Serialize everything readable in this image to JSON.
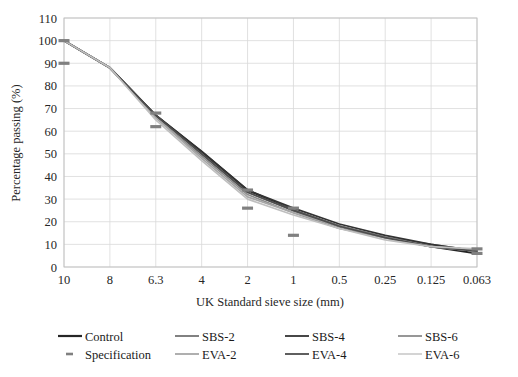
{
  "chart_data": {
    "type": "line",
    "title": "",
    "subtitle": "",
    "xlabel": "UK Standard sieve size (mm)",
    "ylabel": "Percentage passing (%)",
    "categories": [
      "10",
      "8",
      "6.3",
      "4",
      "2",
      "1",
      "0.5",
      "0.25",
      "0.125",
      "0.063"
    ],
    "x_axis_scale": "categorical-descending-sieve",
    "ylim": [
      0,
      110
    ],
    "ytick_step": 10,
    "yticks": [
      "110",
      "100",
      "90",
      "80",
      "70",
      "60",
      "50",
      "40",
      "30",
      "20",
      "10",
      "0"
    ],
    "grid": {
      "horizontal": true,
      "vertical": true,
      "color": "#d9d9d9"
    },
    "legend_position": "bottom",
    "legend_columns": 4,
    "series": [
      {
        "name": "Control",
        "color": "#262626",
        "style": "solid",
        "width": 2.0,
        "values": [
          100,
          88,
          67,
          51,
          34,
          25,
          18,
          13,
          9,
          6
        ]
      },
      {
        "name": "SBS-2",
        "color": "#737373",
        "style": "solid",
        "width": 1.7,
        "values": [
          100,
          88,
          67,
          50,
          33,
          25,
          18,
          13,
          10,
          7
        ]
      },
      {
        "name": "SBS-4",
        "color": "#333333",
        "style": "solid",
        "width": 1.7,
        "values": [
          100,
          88,
          67,
          51,
          34,
          26,
          19,
          14,
          10,
          7
        ]
      },
      {
        "name": "SBS-6",
        "color": "#8c8c8c",
        "style": "solid",
        "width": 1.7,
        "values": [
          100,
          88,
          66,
          49,
          32,
          24,
          17,
          13,
          9,
          7
        ]
      },
      {
        "name": "Specification",
        "color": "#808080",
        "style": "dashed-markers",
        "width": 2.4,
        "values": [
          90,
          null,
          62,
          null,
          26,
          14,
          null,
          null,
          null,
          6
        ]
      },
      {
        "name": "EVA-2",
        "color": "#a6a6a6",
        "style": "solid",
        "width": 1.7,
        "values": [
          100,
          88,
          66,
          48,
          31,
          24,
          18,
          13,
          9,
          7
        ]
      },
      {
        "name": "EVA-4",
        "color": "#4d4d4d",
        "style": "solid",
        "width": 1.7,
        "values": [
          100,
          88,
          67,
          50,
          33,
          25,
          18,
          13,
          9,
          7
        ]
      },
      {
        "name": "EVA-6",
        "color": "#bfbfbf",
        "style": "solid",
        "width": 1.7,
        "values": [
          100,
          88,
          65,
          47,
          30,
          23,
          17,
          12,
          9,
          8
        ]
      }
    ],
    "spec_band_points": [
      {
        "category": "10",
        "value": 90
      },
      {
        "category": "10",
        "value": 100
      },
      {
        "category": "6.3",
        "value": 62
      },
      {
        "category": "6.3",
        "value": 68
      },
      {
        "category": "2",
        "value": 26
      },
      {
        "category": "2",
        "value": 34
      },
      {
        "category": "1",
        "value": 14
      },
      {
        "category": "1",
        "value": 26
      },
      {
        "category": "0.063",
        "value": 6
      },
      {
        "category": "0.063",
        "value": 8
      }
    ]
  },
  "legend": {
    "items": [
      {
        "label": "Control",
        "color": "#262626",
        "style": "solid",
        "width": 2.2
      },
      {
        "label": "SBS-2",
        "color": "#737373",
        "style": "solid",
        "width": 1.8
      },
      {
        "label": "SBS-4",
        "color": "#333333",
        "style": "solid",
        "width": 1.8
      },
      {
        "label": "SBS-6",
        "color": "#8c8c8c",
        "style": "solid",
        "width": 1.8
      },
      {
        "label": "Specification",
        "color": "#808080",
        "style": "dash",
        "width": 2.6
      },
      {
        "label": "EVA-2",
        "color": "#a6a6a6",
        "style": "solid",
        "width": 1.8
      },
      {
        "label": "EVA-4",
        "color": "#4d4d4d",
        "style": "solid",
        "width": 1.8
      },
      {
        "label": "EVA-6",
        "color": "#d0d0d0",
        "style": "solid",
        "width": 1.8
      }
    ]
  },
  "colors": {
    "background": "#ffffff",
    "grid": "#d9d9d9",
    "axis": "#bfbfbf",
    "text": "#262626"
  }
}
